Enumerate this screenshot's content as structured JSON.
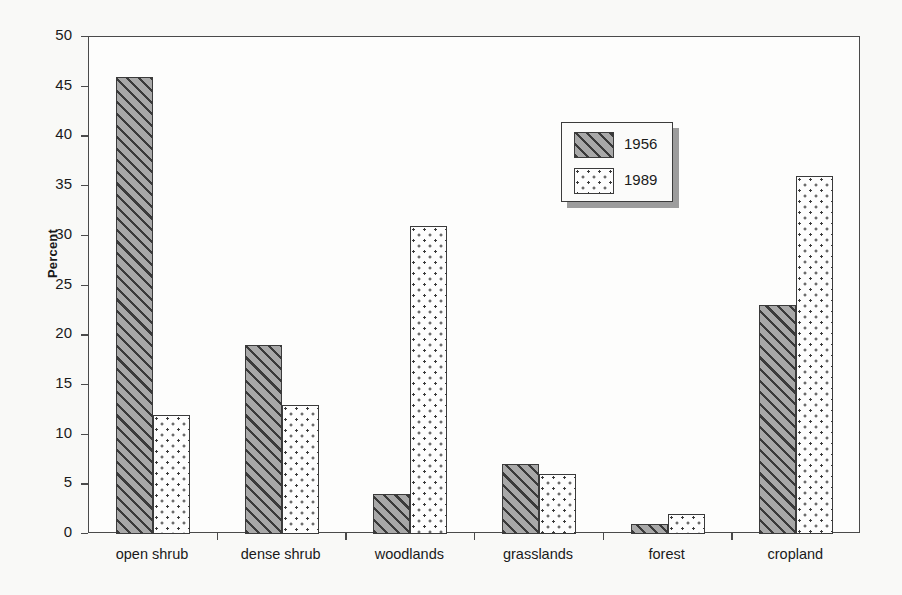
{
  "chart_data": {
    "type": "bar",
    "title": "",
    "subtitle": "",
    "xlabel": "",
    "ylabel": "Percent",
    "ylim": [
      0,
      50
    ],
    "yticks": [
      0,
      5,
      10,
      15,
      20,
      25,
      30,
      35,
      40,
      45,
      50
    ],
    "ytick_labels": [
      "0",
      "5",
      "10",
      "15",
      "20",
      "25",
      "30",
      "35",
      "40",
      "45",
      "50"
    ],
    "grid": false,
    "legend_position": "upper-center-right",
    "categories": [
      "open shrub",
      "dense shrub",
      "woodlands",
      "grasslands",
      "forest",
      "cropland"
    ],
    "series": [
      {
        "name": "1956",
        "pattern": "diagonal-hatch",
        "fill": "#a8a8a8",
        "values": [
          46,
          19,
          4,
          7,
          1,
          23
        ]
      },
      {
        "name": "1989",
        "pattern": "dotted",
        "fill": "#fdfdfd",
        "values": [
          12,
          13,
          31,
          6,
          2,
          36
        ]
      }
    ],
    "annotations": []
  },
  "legend": {
    "entries": [
      {
        "label": "1956"
      },
      {
        "label": "1989"
      }
    ]
  },
  "colors": {
    "background": "#f9f9f7",
    "plot_background": "#fdfdfc",
    "axis": "#4a4a4a",
    "text": "#1a1a1a",
    "series_1956": "#a8a8a8",
    "series_1989": "#fdfdfd",
    "pattern_ink": "#3a3a3a",
    "legend_shadow": "#9d9d9d"
  }
}
